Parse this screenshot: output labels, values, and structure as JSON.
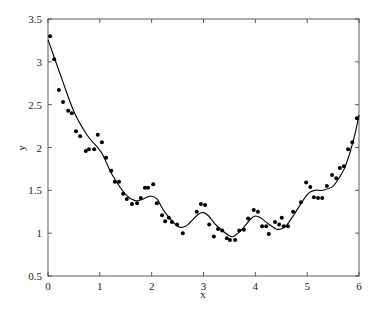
{
  "chart_data": {
    "type": "scatter",
    "title": "",
    "xlabel": "x",
    "ylabel": "y",
    "xlim": [
      0,
      6
    ],
    "ylim": [
      0.5,
      3.5
    ],
    "grid": false,
    "legend": null,
    "xticks": [
      "0",
      "1",
      "2",
      "3",
      "4",
      "5",
      "6"
    ],
    "yticks": [
      "0.5",
      "1",
      "1.5",
      "2",
      "2.5",
      "3",
      "3.5"
    ],
    "series": [
      {
        "name": "data",
        "kind": "scatter",
        "color": "#000000",
        "points": [
          [
            0.04,
            3.3
          ],
          [
            0.12,
            3.03
          ],
          [
            0.21,
            2.67
          ],
          [
            0.29,
            2.53
          ],
          [
            0.39,
            2.43
          ],
          [
            0.46,
            2.4
          ],
          [
            0.54,
            2.19
          ],
          [
            0.62,
            2.13
          ],
          [
            0.73,
            1.96
          ],
          [
            0.79,
            1.98
          ],
          [
            0.89,
            1.98
          ],
          [
            0.96,
            2.15
          ],
          [
            1.04,
            2.06
          ],
          [
            1.12,
            1.88
          ],
          [
            1.22,
            1.73
          ],
          [
            1.29,
            1.6
          ],
          [
            1.37,
            1.6
          ],
          [
            1.45,
            1.46
          ],
          [
            1.52,
            1.4
          ],
          [
            1.62,
            1.34
          ],
          [
            1.72,
            1.35
          ],
          [
            1.79,
            1.41
          ],
          [
            1.87,
            1.53
          ],
          [
            1.93,
            1.53
          ],
          [
            2.03,
            1.57
          ],
          [
            2.1,
            1.35
          ],
          [
            2.2,
            1.21
          ],
          [
            2.26,
            1.14
          ],
          [
            2.33,
            1.18
          ],
          [
            2.39,
            1.13
          ],
          [
            2.49,
            1.1
          ],
          [
            2.6,
            1.0
          ],
          [
            2.87,
            1.25
          ],
          [
            2.95,
            1.34
          ],
          [
            3.03,
            1.33
          ],
          [
            3.11,
            1.1
          ],
          [
            3.2,
            0.96
          ],
          [
            3.28,
            1.05
          ],
          [
            3.36,
            1.03
          ],
          [
            3.45,
            0.94
          ],
          [
            3.51,
            0.92
          ],
          [
            3.61,
            0.92
          ],
          [
            3.69,
            1.03
          ],
          [
            3.78,
            1.04
          ],
          [
            3.86,
            1.17
          ],
          [
            3.97,
            1.27
          ],
          [
            4.05,
            1.25
          ],
          [
            4.13,
            1.08
          ],
          [
            4.21,
            1.08
          ],
          [
            4.26,
            0.99
          ],
          [
            4.38,
            1.13
          ],
          [
            4.46,
            1.1
          ],
          [
            4.51,
            1.18
          ],
          [
            4.55,
            1.08
          ],
          [
            4.63,
            1.08
          ],
          [
            4.73,
            1.25
          ],
          [
            4.88,
            1.36
          ],
          [
            4.98,
            1.59
          ],
          [
            5.06,
            1.54
          ],
          [
            5.13,
            1.42
          ],
          [
            5.21,
            1.41
          ],
          [
            5.29,
            1.41
          ],
          [
            5.38,
            1.55
          ],
          [
            5.48,
            1.68
          ],
          [
            5.56,
            1.64
          ],
          [
            5.63,
            1.76
          ],
          [
            5.71,
            1.78
          ],
          [
            5.79,
            1.98
          ],
          [
            5.87,
            2.06
          ],
          [
            5.96,
            2.34
          ]
        ]
      },
      {
        "name": "fit",
        "kind": "line",
        "color": "#000000",
        "points": [
          [
            0.0,
            3.26
          ],
          [
            0.25,
            2.83
          ],
          [
            0.5,
            2.42
          ],
          [
            0.75,
            2.15
          ],
          [
            1.0,
            1.97
          ],
          [
            1.1,
            1.86
          ],
          [
            1.25,
            1.67
          ],
          [
            1.5,
            1.45
          ],
          [
            1.68,
            1.38
          ],
          [
            1.8,
            1.39
          ],
          [
            1.97,
            1.43
          ],
          [
            2.1,
            1.4
          ],
          [
            2.25,
            1.25
          ],
          [
            2.5,
            1.08
          ],
          [
            2.65,
            1.08
          ],
          [
            2.75,
            1.13
          ],
          [
            2.9,
            1.22
          ],
          [
            3.0,
            1.24
          ],
          [
            3.1,
            1.2
          ],
          [
            3.25,
            1.09
          ],
          [
            3.5,
            0.97
          ],
          [
            3.6,
            0.97
          ],
          [
            3.75,
            1.05
          ],
          [
            3.9,
            1.16
          ],
          [
            4.0,
            1.2
          ],
          [
            4.1,
            1.18
          ],
          [
            4.25,
            1.11
          ],
          [
            4.4,
            1.05
          ],
          [
            4.5,
            1.05
          ],
          [
            4.6,
            1.09
          ],
          [
            4.75,
            1.22
          ],
          [
            5.0,
            1.45
          ],
          [
            5.15,
            1.5
          ],
          [
            5.3,
            1.5
          ],
          [
            5.5,
            1.55
          ],
          [
            5.65,
            1.68
          ],
          [
            5.75,
            1.8
          ],
          [
            5.9,
            2.1
          ],
          [
            6.0,
            2.38
          ]
        ]
      }
    ]
  }
}
